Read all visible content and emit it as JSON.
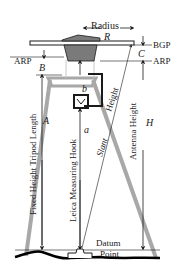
{
  "diagram": {
    "title_labels": {
      "radius": "Radius",
      "radius_symbol": "R",
      "bgp": "BGP",
      "c_symbol": "C",
      "arp_right": "ARP",
      "arp_left": "ARP",
      "b_upper_symbol": "B",
      "b_lower_symbol": "b",
      "a_symbol": "a",
      "a_upper_symbol": "A",
      "h_symbol": "H",
      "fixed_height_tripod_length": "Fixed Height Tripod Length",
      "leica_measuring_hook": "Leica Measuring Hook",
      "height": "Height",
      "slant": "Slant",
      "antenna_height": "Antenna Height",
      "datum": "Datum",
      "point": "Point"
    },
    "colors": {
      "antenna_body": "#7a7a7a",
      "tripod": "#a8a8a8",
      "lines": "#1a1a1a",
      "ground": "#000000"
    }
  }
}
